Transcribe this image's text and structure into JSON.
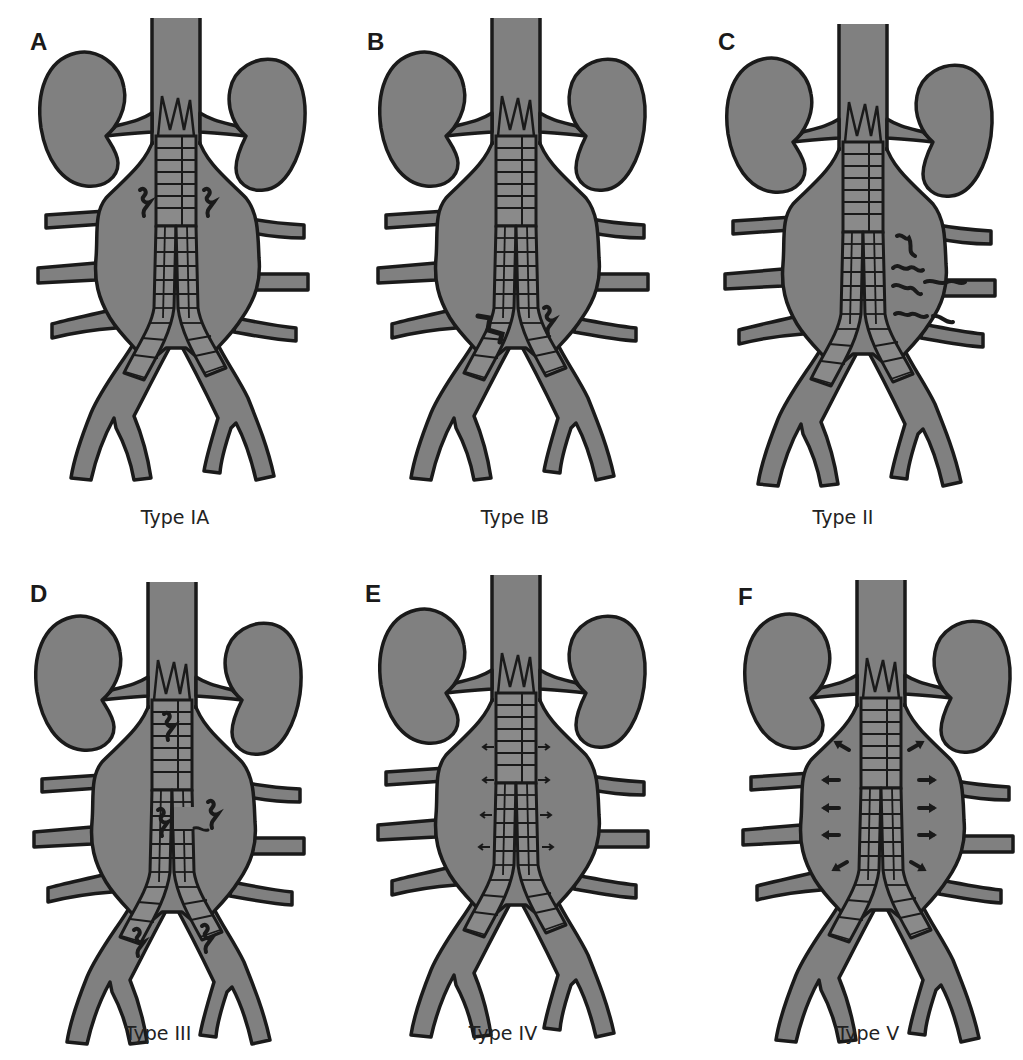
{
  "figure": {
    "colors": {
      "tissue_fill": "#808080",
      "outline": "#1a1a1a",
      "background": "#ffffff"
    },
    "panels": [
      {
        "letter": "A",
        "caption": "Type IA",
        "leak": "proximal-attachment"
      },
      {
        "letter": "B",
        "caption": "Type IB",
        "leak": "distal-attachment"
      },
      {
        "letter": "C",
        "caption": "Type II",
        "leak": "branch-backflow"
      },
      {
        "letter": "D",
        "caption": "Type III",
        "leak": "graft-defect-separation"
      },
      {
        "letter": "E",
        "caption": "Type IV",
        "leak": "graft-porosity"
      },
      {
        "letter": "F",
        "caption": "Type V",
        "leak": "endotension"
      }
    ]
  }
}
